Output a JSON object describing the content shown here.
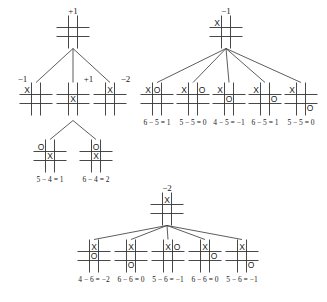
{
  "trees": [
    {
      "id": "tree-left",
      "root": {
        "x": 73,
        "y": 32,
        "value": "+1",
        "board": [
          "",
          "",
          "",
          "",
          "",
          "",
          "",
          "",
          ""
        ]
      },
      "children": [
        {
          "x": 36,
          "y": 99,
          "value": "−1",
          "value_pos": "left",
          "board": [
            "X",
            "",
            "",
            "",
            "",
            "",
            "",
            "",
            ""
          ],
          "calc": ""
        },
        {
          "x": 73,
          "y": 99,
          "value": "+1",
          "value_pos": "right",
          "board": [
            "",
            "",
            "",
            "",
            "X",
            "",
            "",
            "",
            ""
          ],
          "calc": ""
        },
        {
          "x": 110,
          "y": 99,
          "value": "−2",
          "value_pos": "right",
          "board": [
            "",
            "X",
            "",
            "",
            "",
            "",
            "",
            "",
            ""
          ],
          "calc": ""
        }
      ],
      "grandchildren": {
        "parent_index": 1,
        "nodes": [
          {
            "x": 50,
            "y": 156,
            "board": [
              "O",
              "",
              "",
              "",
              "X",
              "",
              "",
              "",
              ""
            ],
            "calc": "5 − 4 = 1"
          },
          {
            "x": 96,
            "y": 156,
            "board": [
              "",
              "O",
              "",
              "",
              "X",
              "",
              "",
              "",
              ""
            ],
            "calc": "6 − 4 = 2"
          }
        ]
      }
    },
    {
      "id": "tree-right",
      "root": {
        "x": 226,
        "y": 32,
        "value": "−1",
        "board": [
          "X",
          "",
          "",
          "",
          "",
          "",
          "",
          "",
          ""
        ]
      },
      "children": [
        {
          "x": 157,
          "y": 99,
          "board": [
            "X",
            "O",
            "",
            "",
            "",
            "",
            "",
            "",
            ""
          ],
          "calc": "6 − 5 = 1"
        },
        {
          "x": 193,
          "y": 99,
          "board": [
            "X",
            "",
            "O",
            "",
            "",
            "",
            "",
            "",
            ""
          ],
          "calc": "5 − 5 = 0"
        },
        {
          "x": 229,
          "y": 99,
          "board": [
            "X",
            "",
            "",
            "",
            "O",
            "",
            "",
            "",
            ""
          ],
          "calc": "4 − 5 = −1"
        },
        {
          "x": 265,
          "y": 99,
          "board": [
            "X",
            "",
            "",
            "",
            "",
            "O",
            "",
            "",
            ""
          ],
          "calc": "6 − 5 = 1"
        },
        {
          "x": 301,
          "y": 99,
          "board": [
            "X",
            "",
            "",
            "",
            "",
            "",
            "",
            "",
            "O"
          ],
          "calc": "5 − 5 = 0"
        }
      ]
    },
    {
      "id": "tree-bottom",
      "root": {
        "x": 167,
        "y": 209,
        "value": "−2",
        "board": [
          "",
          "X",
          "",
          "",
          "",
          "",
          "",
          "",
          ""
        ]
      },
      "children": [
        {
          "x": 94,
          "y": 256,
          "board": [
            "",
            "X",
            "",
            "",
            "O",
            "",
            "",
            "",
            ""
          ],
          "calc": "4 − 6 = −2"
        },
        {
          "x": 131,
          "y": 256,
          "board": [
            "",
            "X",
            "",
            "",
            "",
            "",
            "",
            "O",
            ""
          ],
          "calc": "6 − 6 = 0"
        },
        {
          "x": 168,
          "y": 256,
          "board": [
            "",
            "X",
            "O",
            "",
            "",
            "",
            "",
            "",
            ""
          ],
          "calc": "5 − 6 = −1"
        },
        {
          "x": 205,
          "y": 256,
          "board": [
            "",
            "X",
            "",
            "",
            "",
            "O",
            "",
            "",
            ""
          ],
          "calc": "6 − 6 = 0"
        },
        {
          "x": 242,
          "y": 256,
          "board": [
            "",
            "X",
            "",
            "",
            "",
            "",
            "",
            "",
            "O"
          ],
          "calc": "5 − 6 = −1"
        }
      ]
    }
  ],
  "colors": {
    "line": "#333333",
    "text": "#222222",
    "background": "#ffffff"
  }
}
